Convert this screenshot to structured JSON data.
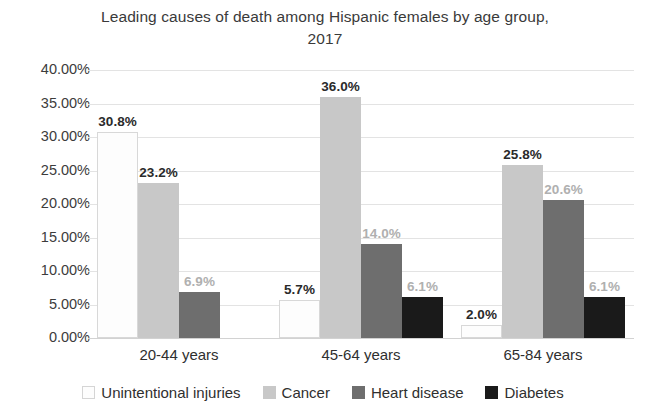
{
  "chart_data": {
    "type": "bar",
    "title": "Leading causes of death among Hispanic females by age group,\n2017",
    "xlabel": "",
    "ylabel": "",
    "categories": [
      "20-44 years",
      "45-64 years",
      "65-84 years"
    ],
    "series": [
      {
        "name": "Unintentional injuries",
        "color": "#fdfdfd",
        "values": [
          30.8,
          5.7,
          2.0
        ],
        "labels": [
          "30.8%",
          "5.7%",
          "2.0%"
        ],
        "label_style": [
          "dark",
          "dark",
          "dark"
        ]
      },
      {
        "name": "Cancer",
        "color": "#c8c8c8",
        "values": [
          23.2,
          36.0,
          25.8
        ],
        "labels": [
          "23.2%",
          "36.0%",
          "25.8%"
        ],
        "label_style": [
          "dark",
          "dark",
          "dark"
        ]
      },
      {
        "name": "Heart disease",
        "color": "#6e6e6e",
        "values": [
          6.9,
          14.0,
          20.6
        ],
        "labels": [
          "6.9%",
          "14.0%",
          "20.6%"
        ],
        "label_style": [
          "light",
          "light",
          "light"
        ]
      },
      {
        "name": "Diabetes",
        "color": "#1a1a1a",
        "values": [
          null,
          6.1,
          6.1
        ],
        "labels": [
          "",
          "6.1%",
          "6.1%"
        ],
        "label_style": [
          "light",
          "light",
          "light"
        ]
      }
    ],
    "ylim": [
      0,
      40
    ],
    "ytick_values": [
      0,
      5,
      10,
      15,
      20,
      25,
      30,
      35,
      40
    ],
    "ytick_labels": [
      "0.00%",
      "5.00%",
      "10.00%",
      "15.00%",
      "20.00%",
      "25.00%",
      "30.00%",
      "35.00%",
      "40.00%"
    ],
    "grid": true,
    "legend_position": "bottom",
    "legend_entries": [
      "Unintentional injuries",
      "Cancer",
      "Heart disease",
      "Diabetes"
    ]
  }
}
